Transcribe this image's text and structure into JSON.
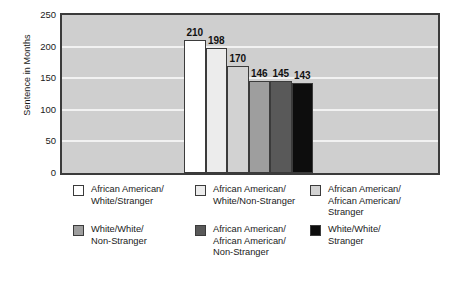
{
  "chart_data": {
    "type": "bar",
    "title": "",
    "subtitle": "",
    "xlabel": "",
    "ylabel": "Sentence in Months",
    "ylim": [
      0,
      250
    ],
    "yticks": [
      250,
      200,
      150,
      100,
      50,
      0
    ],
    "grid": true,
    "grid_orientation": "horizontal",
    "legend_position": "bottom",
    "legend_columns": 3,
    "categories": [
      "African American/White/Stranger",
      "African American/White/Non-Stranger",
      "African American/African American/Stranger",
      "White/White/Non-Stranger",
      "African American/African American/Non-Stranger",
      "White/White/Stranger"
    ],
    "values": [
      210,
      198,
      170,
      146,
      145,
      143
    ],
    "data_labels": [
      "210",
      "198",
      "170",
      "146",
      "145",
      "143"
    ],
    "bar_colors": [
      "#ffffff",
      "#ececec",
      "#d2d2d2",
      "#9e9e9e",
      "#595959",
      "#0d0d0d"
    ],
    "bar_border_color": "#3b3b3b"
  },
  "axis": {
    "y_title": "Sentence in Months",
    "y_ticks": [
      {
        "label": "250",
        "value": 250
      },
      {
        "label": "200",
        "value": 200
      },
      {
        "label": "150",
        "value": 150
      },
      {
        "label": "100",
        "value": 100
      },
      {
        "label": "50",
        "value": 50
      },
      {
        "label": "0",
        "value": 0
      }
    ]
  },
  "plot": {
    "background_color": "#cfcfcf",
    "border_color": "#3b3b3b",
    "gridline_color": "#f2f2f2"
  },
  "bars": [
    {
      "label": "210",
      "value": 210,
      "color": "#ffffff"
    },
    {
      "label": "198",
      "value": 198,
      "color": "#ececec"
    },
    {
      "label": "170",
      "value": 170,
      "color": "#d2d2d2"
    },
    {
      "label": "146",
      "value": 146,
      "color": "#9e9e9e"
    },
    {
      "label": "145",
      "value": 145,
      "color": "#595959"
    },
    {
      "label": "143",
      "value": 143,
      "color": "#0d0d0d"
    }
  ],
  "legend": {
    "items": [
      {
        "label": "African American/\nWhite/Stranger",
        "color": "#ffffff"
      },
      {
        "label": "African American/\nWhite/Non-Stranger",
        "color": "#ececec"
      },
      {
        "label": "African American/\nAfrican American/\nStranger",
        "color": "#d2d2d2"
      },
      {
        "label": "White/White/\nNon-Stranger",
        "color": "#9e9e9e"
      },
      {
        "label": "African American/\nAfrican American/\nNon-Stranger",
        "color": "#595959"
      },
      {
        "label": "White/White/\nStranger",
        "color": "#0d0d0d"
      }
    ]
  }
}
